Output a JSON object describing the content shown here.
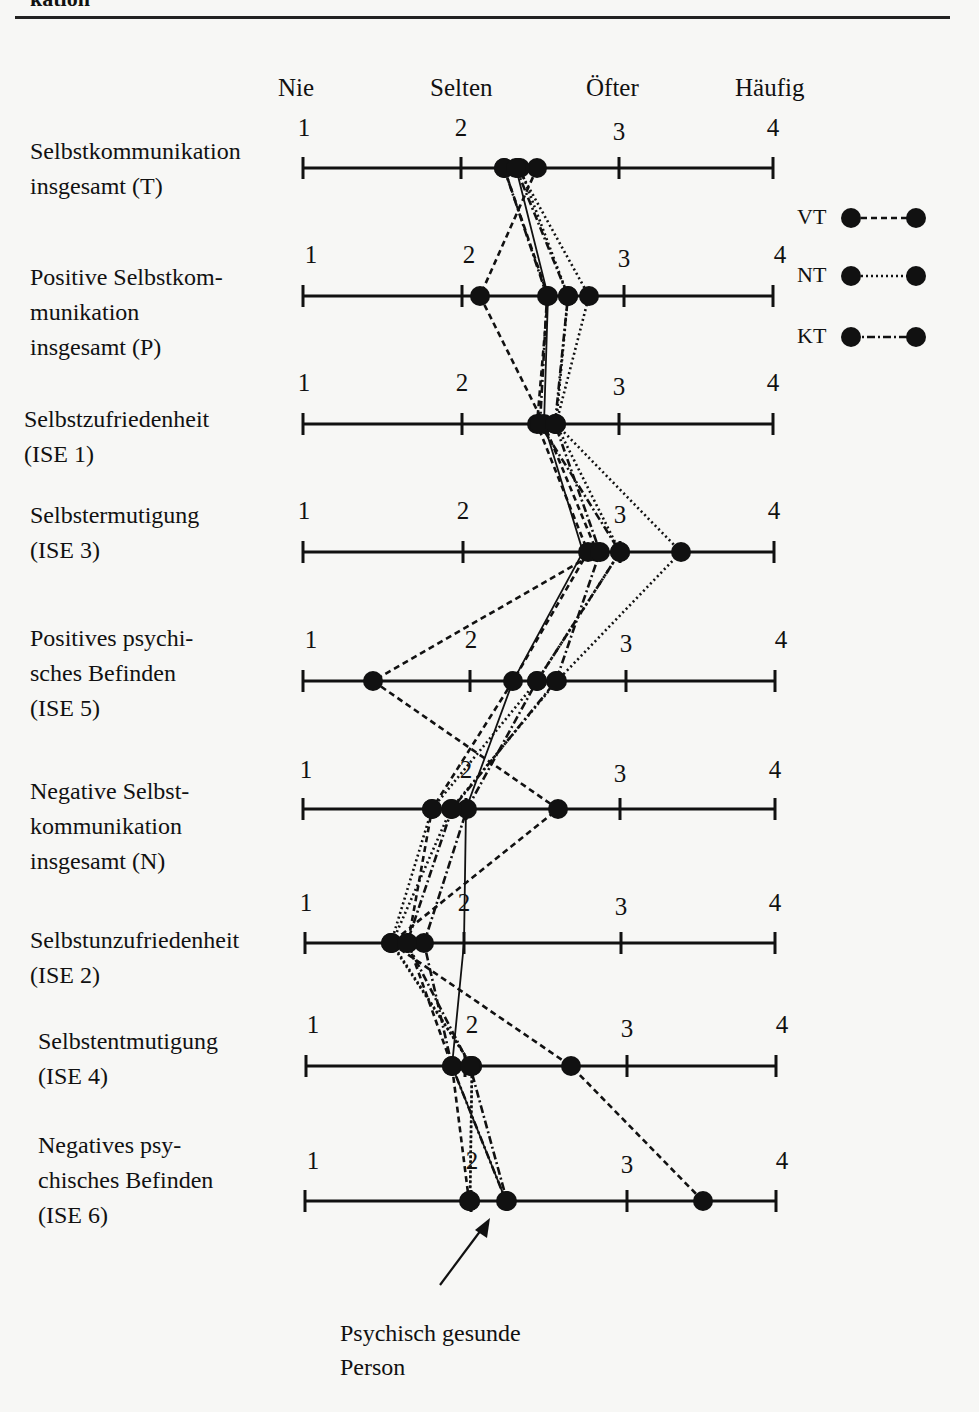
{
  "page": {
    "header_fragment": "kation"
  },
  "chart_data": {
    "type": "line",
    "title": "",
    "orientation": "horizontal-profile",
    "scale_anchors": [
      {
        "value": 1,
        "label": "Nie"
      },
      {
        "value": 2,
        "label": "Selten"
      },
      {
        "value": 3,
        "label": "Öfter"
      },
      {
        "value": 4,
        "label": "Häufig"
      }
    ],
    "xlim": [
      1,
      4
    ],
    "categories": [
      "Selbstkommunikation insgesamt (T)",
      "Positive Selbstkommunikation insgesamt (P)",
      "Selbstzufriedenheit (ISE 1)",
      "Selbstermutigung (ISE 3)",
      "Positives psychisches Befinden (ISE 5)",
      "Negative Selbstkommunikation insgesamt (N)",
      "Selbstunzufriedenheit (ISE 2)",
      "Selbstentmutigung (ISE 4)",
      "Negatives psychisches Befinden (ISE 6)"
    ],
    "series": [
      {
        "name": "VT (vorher)",
        "style": "dashed",
        "values": [
          2.3,
          2.1,
          2.5,
          2.85,
          1.45,
          2.6,
          2.15,
          2.65,
          3.5
        ]
      },
      {
        "name": "VT (nachher)",
        "style": "dashed",
        "values": [
          2.35,
          2.55,
          2.5,
          2.95,
          2.45,
          1.8,
          1.7,
          2.1,
          2.2
        ]
      },
      {
        "name": "NT (vorher)",
        "style": "dotted",
        "values": [
          2.45,
          2.7,
          2.6,
          3.4,
          2.6,
          1.75,
          1.55,
          2.05,
          2.0
        ]
      },
      {
        "name": "NT (nachher)",
        "style": "dotted",
        "values": [
          2.35,
          2.6,
          2.55,
          3.0,
          2.55,
          1.8,
          1.55,
          2.1,
          2.0
        ]
      },
      {
        "name": "KT (vorher)",
        "style": "dashdot",
        "values": [
          2.3,
          2.55,
          2.55,
          3.0,
          2.45,
          1.9,
          1.65,
          2.05,
          2.2
        ]
      },
      {
        "name": "KT (nachher)",
        "style": "dashdot",
        "values": [
          2.35,
          2.65,
          2.55,
          2.95,
          2.5,
          1.85,
          1.65,
          2.1,
          2.2
        ]
      },
      {
        "name": "Psychisch gesunde Person",
        "style": "solid",
        "values": [
          2.35,
          2.55,
          2.5,
          2.85,
          2.35,
          2.05,
          2.0,
          1.95,
          2.2
        ]
      }
    ],
    "legend": [
      {
        "label": "VT",
        "style": "dashed"
      },
      {
        "label": "NT",
        "style": "dotted"
      },
      {
        "label": "KT",
        "style": "dashdot"
      }
    ],
    "legend_position": "right",
    "annotation": "Psychisch gesunde Person",
    "grid": false
  },
  "rows": [
    {
      "label": "Selbstkommunikation\ninsgesamt (T)",
      "label_x": 30,
      "label_y": 134,
      "axis_y": 168,
      "num_y": 116,
      "ticks": [
        303,
        461,
        619,
        773
      ],
      "num_x": [
        304,
        461,
        619,
        773
      ]
    },
    {
      "label": "Positive Selbstkom-\nmunikation\ninsgesamt (P)",
      "label_x": 30,
      "label_y": 260,
      "axis_y": 296,
      "num_y": 243,
      "ticks": [
        303,
        462,
        624,
        773
      ],
      "num_x": [
        311,
        469,
        624,
        780
      ]
    },
    {
      "label": "Selbstzufriedenheit\n(ISE 1)",
      "label_x": 24,
      "label_y": 402,
      "axis_y": 424,
      "num_y": 371,
      "ticks": [
        303,
        462,
        619,
        773
      ],
      "num_x": [
        304,
        462,
        619,
        773
      ]
    },
    {
      "label": "Selbstermutigung\n(ISE 3)",
      "label_x": 30,
      "label_y": 498,
      "axis_y": 552,
      "num_y": 499,
      "ticks": [
        303,
        463,
        620,
        774
      ],
      "num_x": [
        304,
        463,
        620,
        774
      ]
    },
    {
      "label": "Positives psychi-\nsches Befinden\n(ISE 5)",
      "label_x": 30,
      "label_y": 621,
      "axis_y": 681,
      "num_y": 628,
      "ticks": [
        303,
        470,
        626,
        775
      ],
      "num_x": [
        311,
        471,
        626,
        781
      ]
    },
    {
      "label": "Negative Selbst-\nkommunikation\ninsgesamt (N)",
      "label_x": 30,
      "label_y": 774,
      "axis_y": 809,
      "num_y": 758,
      "ticks": [
        303,
        466,
        620,
        775
      ],
      "num_x": [
        306,
        466,
        620,
        775
      ]
    },
    {
      "label": "Selbstunzufriedenheit\n(ISE 2)",
      "label_x": 30,
      "label_y": 923,
      "axis_y": 943,
      "num_y": 891,
      "ticks": [
        305,
        464,
        621,
        775
      ],
      "num_x": [
        306,
        464,
        621,
        775
      ]
    },
    {
      "label": "Selbstentmutigung\n(ISE 4)",
      "label_x": 38,
      "label_y": 1024,
      "axis_y": 1066,
      "num_y": 1013,
      "ticks": [
        306,
        465,
        627,
        776
      ],
      "num_x": [
        313,
        472,
        627,
        782
      ]
    },
    {
      "label": "Negatives psy-\nchisches Befinden\n(ISE 6)",
      "label_x": 38,
      "label_y": 1128,
      "axis_y": 1201,
      "num_y": 1149,
      "ticks": [
        305,
        471,
        627,
        776
      ],
      "num_x": [
        313,
        472,
        627,
        782
      ]
    }
  ],
  "points": {
    "VT_pre": [
      537,
      480,
      544,
      597,
      373,
      558,
      391,
      571,
      703
    ],
    "VT_post": [
      504,
      548,
      537,
      588,
      513,
      432,
      408,
      452,
      469
    ],
    "NT_pre": [
      518,
      589,
      556,
      681,
      557,
      451,
      392,
      472,
      470
    ],
    "NT_post": [
      520,
      568,
      556,
      620,
      537,
      432,
      391,
      472,
      470
    ],
    "KT_pre": [
      504,
      547,
      540,
      620,
      537,
      467,
      424,
      452,
      506
    ],
    "KT_post": [
      516,
      568,
      555,
      600,
      556,
      452,
      407,
      470,
      507
    ],
    "healthy": [
      516,
      548,
      544,
      583,
      513,
      466,
      464,
      452,
      506
    ]
  },
  "legend": {
    "items": [
      {
        "label": "VT",
        "y": 218,
        "style": "dashed"
      },
      {
        "label": "NT",
        "y": 276,
        "style": "dotted"
      },
      {
        "label": "KT",
        "y": 337,
        "style": "dashdot"
      }
    ]
  },
  "annotation": {
    "text": "Psychisch gesunde\nPerson",
    "arrow_from": [
      440,
      1285
    ],
    "arrow_to": [
      490,
      1218
    ]
  }
}
